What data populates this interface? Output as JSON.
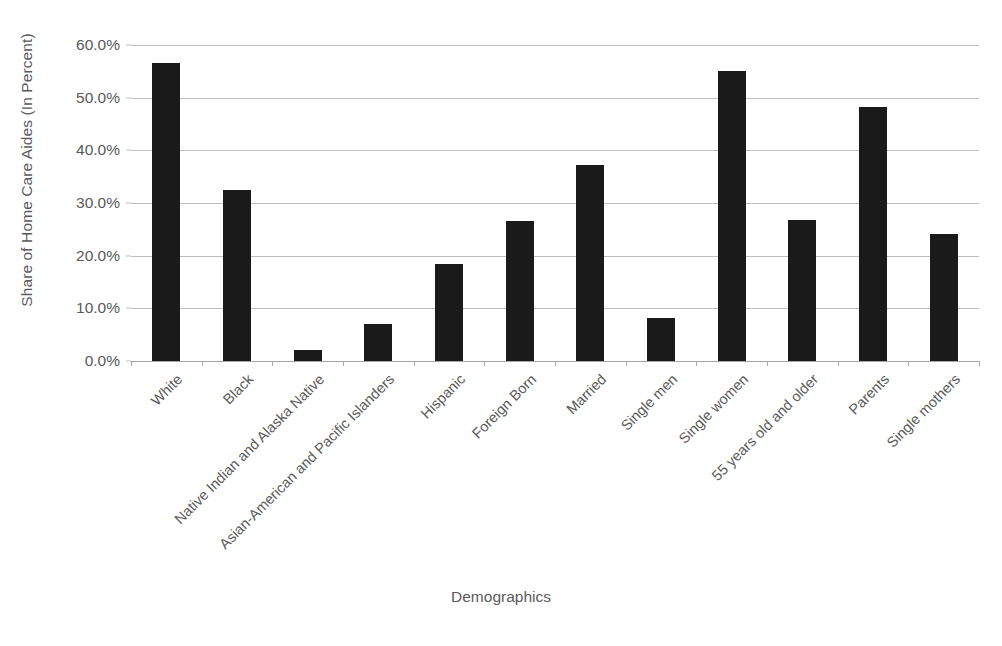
{
  "chart_data": {
    "type": "bar",
    "title": "",
    "xlabel": "Demographics",
    "ylabel": "Share of Home Care Aides (In Percent)",
    "ylim": [
      0,
      60
    ],
    "ytick_labels": [
      "60.0%",
      "50.0%",
      "40.0%",
      "30.0%",
      "20.0%",
      "10.0%",
      "0.0%"
    ],
    "ytick_values": [
      60,
      50,
      40,
      30,
      20,
      10,
      0
    ],
    "grid": true,
    "legend": "none",
    "bar_color": "#1a1a1a",
    "gridline_color": "#bfbfbf",
    "text_color": "#595959",
    "categories": [
      "White",
      "Black",
      "Native Indian and Alaska Native",
      "Asian-American and Pacific Islanders",
      "Hispanic",
      "Foreign Born",
      "Married",
      "Single men",
      "Single women",
      "55 years old and older",
      "Parents",
      "Single mothers"
    ],
    "values": [
      56.5,
      32.4,
      2.0,
      7.0,
      18.5,
      26.6,
      37.3,
      8.2,
      55.1,
      26.8,
      48.2,
      24.2
    ]
  }
}
